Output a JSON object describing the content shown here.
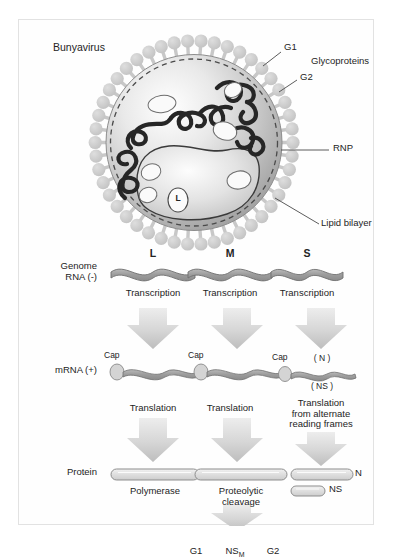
{
  "figure": {
    "title": "Bunyavirus",
    "virion": {
      "core_label": "L",
      "callouts": [
        {
          "name": "g1",
          "text": "G1"
        },
        {
          "name": "glycoproteins",
          "text": "Glycoproteins"
        },
        {
          "name": "g2",
          "text": "G2"
        },
        {
          "name": "rnp",
          "text": "RNP"
        },
        {
          "name": "lipid-bilayer",
          "text": "Lipid bilayer"
        }
      ]
    },
    "replication": {
      "row_labels": [
        {
          "name": "genome-rna",
          "line1": "Genome",
          "line2": "RNA (-)"
        },
        {
          "name": "mrna",
          "line1": "mRNA (+)",
          "line2": ""
        },
        {
          "name": "protein",
          "line1": "Protein",
          "line2": ""
        }
      ],
      "segments": [
        {
          "name": "l-segment",
          "header": "L",
          "transcription": "Transcription",
          "cap": "Cap",
          "translation": "Translation",
          "protein": "Polymerase"
        },
        {
          "name": "m-segment",
          "header": "M",
          "transcription": "Transcription",
          "cap": "Cap",
          "translation": "Translation",
          "protein_step1": "Proteolytic",
          "protein_step2": "cleavage",
          "products": [
            {
              "name": "g1-product",
              "text": "G1"
            },
            {
              "name": "nsm-product",
              "text": "NS",
              "subscript": "M"
            },
            {
              "name": "g2-product",
              "text": "G2"
            }
          ]
        },
        {
          "name": "s-segment",
          "header": "S",
          "transcription": "Transcription",
          "cap": "Cap",
          "orf_n": "( N )",
          "orf_ns": "( NS )",
          "translation_line1": "Translation",
          "translation_line2": "from alternate",
          "translation_line3": "reading frames",
          "protein_n": "N",
          "protein_ns": "NS"
        }
      ]
    },
    "colors": {
      "spike": "#cfcfcf",
      "envelope_outline": "#6f6f6f",
      "rnp_strand": "#2a2a2a",
      "arrow": "#d2d2d2",
      "ribbon": "#a6a6a6",
      "text": "#242424",
      "frame": "#e2e2e2"
    }
  }
}
